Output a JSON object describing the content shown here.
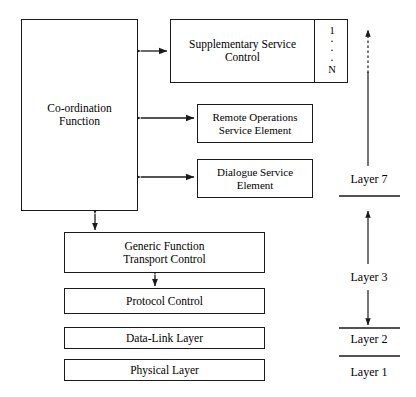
{
  "figure": {
    "type": "block-diagram",
    "background": "#ffffff",
    "line_color": "#1a1a1a"
  },
  "blocks": {
    "coordination": {
      "label": "Co-ordination\nFunction",
      "line1": "Co-ordination",
      "line2": "Function"
    },
    "supplementary_service_control": {
      "line1": "Supplementary Service",
      "line2": "Control",
      "instances": {
        "first": "1",
        "last": "N",
        "ellipsis": "·"
      }
    },
    "remote_operations_service_element": {
      "line1": "Remote Operations",
      "line2": "Service Element"
    },
    "dialogue_service_element": {
      "line1": "Dialogue Service",
      "line2": "Element"
    },
    "generic_function_transport_control": {
      "line1": "Generic Function",
      "line2": "Transport Control"
    },
    "protocol_control": {
      "label": "Protocol Control"
    },
    "data_link_layer": {
      "label": "Data-Link Layer"
    },
    "physical_layer": {
      "label": "Physical Layer"
    }
  },
  "layers": {
    "layer7": "Layer 7",
    "layer3": "Layer 3",
    "layer2": "Layer 2",
    "layer1": "Layer 1"
  },
  "connectors": [
    {
      "name": "coordination-to-ssc",
      "style": "double-arrow-horizontal"
    },
    {
      "name": "coordination-to-rose",
      "style": "double-arrow-horizontal"
    },
    {
      "name": "coordination-to-dse",
      "style": "double-arrow-horizontal"
    },
    {
      "name": "coordination-to-gft",
      "style": "double-arrow-vertical"
    },
    {
      "name": "gft-to-protocol-control",
      "style": "double-arrow-vertical"
    },
    {
      "name": "layer7-span-arrow",
      "style": "dashed-then-solid-up-arrow"
    },
    {
      "name": "layer3-span-arrow",
      "style": "double-arrow-vertical"
    }
  ]
}
